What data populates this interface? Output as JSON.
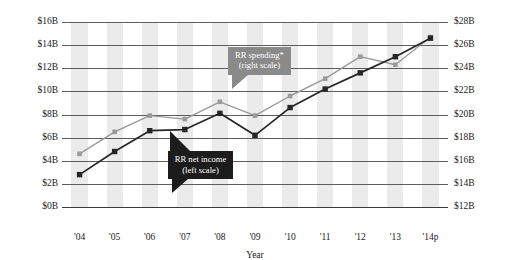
{
  "chart_data": {
    "type": "line",
    "title": "",
    "xlabel": "Year",
    "ylabel": "",
    "grid": true,
    "categories": [
      "'04",
      "'05",
      "'06",
      "'07",
      "'08",
      "'09",
      "'10",
      "'11",
      "'12",
      "'13",
      "'14p"
    ],
    "left_axis": {
      "label": "",
      "ylim": [
        0,
        16
      ],
      "ticks": [
        "$0B",
        "$2B",
        "$4B",
        "$6B",
        "$8B",
        "$10B",
        "$12B",
        "$14B",
        "$16B"
      ],
      "tick_values": [
        0,
        2,
        4,
        6,
        8,
        10,
        12,
        14,
        16
      ]
    },
    "right_axis": {
      "label": "",
      "ylim": [
        12,
        28
      ],
      "ticks": [
        "$12B",
        "$14B",
        "$16B",
        "$18B",
        "$20B",
        "$22B",
        "$24B",
        "$26B",
        "$28B"
      ],
      "tick_values": [
        12,
        14,
        16,
        18,
        20,
        22,
        24,
        26,
        28
      ]
    },
    "series": [
      {
        "name": "RR net income",
        "axis": "left",
        "color": "#262626",
        "marker": "square",
        "values": [
          2.8,
          4.8,
          6.6,
          6.7,
          8.1,
          6.2,
          8.6,
          10.2,
          11.6,
          13.0,
          14.6
        ]
      },
      {
        "name": "RR spending*",
        "axis": "right",
        "color": "#9a9a9a",
        "marker": "square",
        "values": [
          16.6,
          18.5,
          19.9,
          19.6,
          21.1,
          19.9,
          21.6,
          23.1,
          25.0,
          24.3,
          26.7
        ]
      }
    ],
    "annotations": [
      {
        "id": "spending-callout",
        "line1": "RR spending*",
        "line2": "(right scale)",
        "style": "gray"
      },
      {
        "id": "income-callout",
        "line1": "RR net income",
        "line2": "(left scale)",
        "style": "dark"
      }
    ]
  }
}
